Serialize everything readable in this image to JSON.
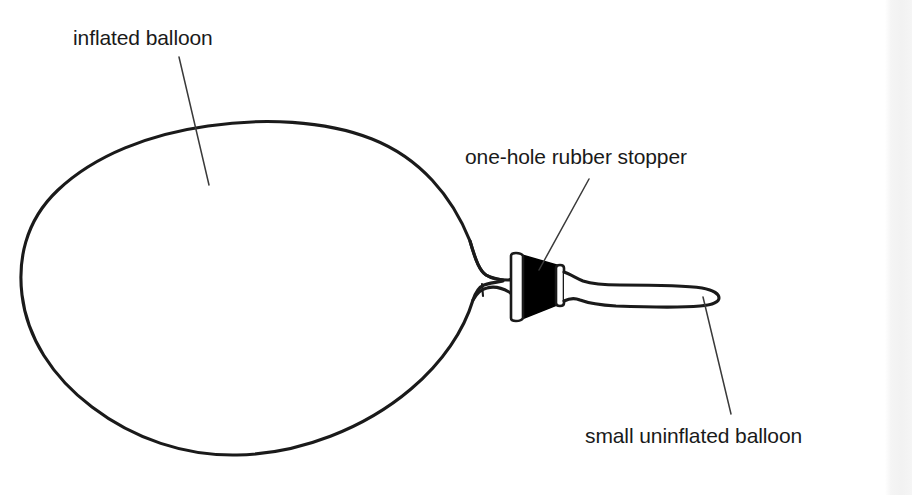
{
  "figure": {
    "kind": "line-diagram",
    "background_color": "#ffffff",
    "ink_color": "#1a1a1a",
    "stopper_fill_color": "#000000"
  },
  "labels": {
    "inflated_balloon": "inflated balloon",
    "rubber_stopper": "one-hole rubber stopper",
    "small_balloon": "small uninflated balloon"
  },
  "parts": {
    "inflated_balloon_name": "inflated balloon",
    "neck_name": "balloon neck",
    "neck_tick_name": "neck crease mark",
    "stopper_body_name": "rubber stopper body",
    "stopper_left_flange_name": "stopper left flange",
    "stopper_right_flange_name": "stopper right flange",
    "small_balloon_name": "small uninflated balloon"
  },
  "leader_lines": {
    "inflated_balloon": "from label down-right to balloon surface",
    "rubber_stopper": "from label down-left to stopper body",
    "small_balloon": "from small balloon down-right to label"
  }
}
